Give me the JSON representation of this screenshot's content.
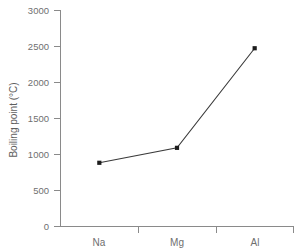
{
  "chart_data": {
    "type": "line",
    "title": "",
    "xlabel": "",
    "ylabel": "Boiling point (°C)",
    "categories": [
      "Na",
      "Mg",
      "Al"
    ],
    "values": [
      883,
      1090,
      2470
    ],
    "series": [
      {
        "name": "Boiling point",
        "values": [
          883,
          1090,
          2470
        ]
      }
    ],
    "ylim": [
      0,
      3000
    ],
    "yticks": [
      0,
      500,
      1000,
      1500,
      2000,
      2500,
      3000
    ],
    "ytick_labels": [
      "0",
      "500",
      "1000",
      "1500",
      "2000",
      "2500",
      "3000"
    ],
    "xtick_labels": [
      "Na",
      "Mg",
      "Al"
    ],
    "grid": false,
    "legend": false,
    "legend_position": "none",
    "marker": "square",
    "line_color": "#3a3a3a",
    "marker_color": "#1d1d1d",
    "axis_color": "#8a8a8a",
    "label_color": "#6f6f6f",
    "background_color": "#ffffff"
  }
}
